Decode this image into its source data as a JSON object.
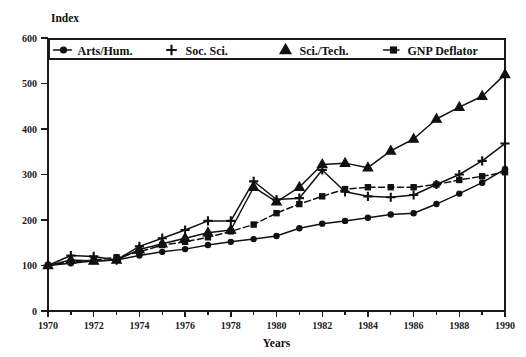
{
  "chart_data": {
    "type": "line",
    "title": "",
    "subtitle": "",
    "xlabel": "Years",
    "ylabel": "Index",
    "xlim": [
      1970,
      1990
    ],
    "ylim": [
      0,
      600
    ],
    "xticks": [
      1970,
      1972,
      1974,
      1976,
      1978,
      1980,
      1982,
      1984,
      1986,
      1988,
      1990
    ],
    "xtick_labels": [
      "1970",
      "1972",
      "1974",
      "1976",
      "1978",
      "1980",
      "1982",
      "1984",
      "1986",
      "1988",
      "1990"
    ],
    "yticks": [
      0,
      100,
      200,
      300,
      400,
      500,
      600
    ],
    "ytick_labels": [
      "0",
      "100",
      "200",
      "300",
      "400",
      "500",
      "600"
    ],
    "xtick_minor": [
      1971,
      1973,
      1975,
      1977,
      1979,
      1981,
      1983,
      1985,
      1987,
      1989
    ],
    "grid": false,
    "legend_position": "top-inside",
    "x": [
      1970,
      1971,
      1972,
      1973,
      1974,
      1975,
      1976,
      1977,
      1978,
      1979,
      1980,
      1981,
      1982,
      1983,
      1984,
      1985,
      1986,
      1987,
      1988,
      1989,
      1990
    ],
    "series": [
      {
        "name": "Arts/Hum.",
        "marker": "filled-circle",
        "linestyle": "solid",
        "color": "#111111",
        "values": [
          100,
          105,
          110,
          112,
          122,
          130,
          136,
          145,
          152,
          158,
          165,
          182,
          192,
          198,
          205,
          212,
          215,
          235,
          258,
          282,
          312
        ]
      },
      {
        "name": "Soc. Sci.",
        "marker": "plus",
        "linestyle": "solid",
        "color": "#111111",
        "values": [
          100,
          122,
          120,
          112,
          142,
          160,
          178,
          198,
          198,
          285,
          245,
          248,
          310,
          262,
          252,
          250,
          255,
          278,
          300,
          330,
          368
        ]
      },
      {
        "name": "Sci./Tech.",
        "marker": "filled-triangle",
        "linestyle": "solid",
        "color": "#111111",
        "values": [
          100,
          112,
          110,
          112,
          135,
          148,
          160,
          172,
          178,
          272,
          240,
          272,
          322,
          325,
          315,
          352,
          378,
          422,
          448,
          472,
          520
        ]
      },
      {
        "name": "GNP Deflator",
        "marker": "filled-square",
        "linestyle": "dashed",
        "color": "#111111",
        "values": [
          100,
          108,
          112,
          118,
          130,
          145,
          152,
          162,
          175,
          190,
          215,
          235,
          252,
          268,
          272,
          272,
          272,
          278,
          288,
          296,
          305
        ]
      }
    ]
  },
  "legend": {
    "entries": [
      {
        "label": "Arts/Hum.",
        "marker": "filled-circle",
        "linestyle": "solid"
      },
      {
        "label": "Soc. Sci.",
        "marker": "plus",
        "linestyle": "none"
      },
      {
        "label": "Sci./Tech.",
        "marker": "filled-triangle",
        "linestyle": "none"
      },
      {
        "label": "GNP Deflator",
        "marker": "filled-square",
        "linestyle": "dashed"
      }
    ]
  }
}
